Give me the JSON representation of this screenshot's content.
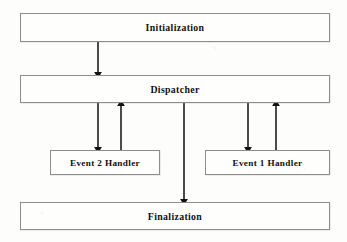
{
  "diagram": {
    "background_color": "#fdfdfb",
    "box_border_color": "#8d8d8d",
    "arrow_color": "#111111",
    "nodes": [
      {
        "id": "initialization",
        "label": "Initialization",
        "x": 20,
        "y": 13,
        "w": 310,
        "h": 29
      },
      {
        "id": "dispatcher",
        "label": "Dispatcher",
        "x": 20,
        "y": 75,
        "w": 310,
        "h": 28
      },
      {
        "id": "event2handler",
        "label": "Event 2 Handler",
        "x": 50,
        "y": 150,
        "w": 110,
        "h": 25
      },
      {
        "id": "event1handler",
        "label": "Event 1 Handler",
        "x": 205,
        "y": 150,
        "w": 125,
        "h": 25
      },
      {
        "id": "finalization",
        "label": "Finalization",
        "x": 20,
        "y": 202,
        "w": 310,
        "h": 28
      }
    ],
    "edges": [
      {
        "id": "init-to-dispatcher",
        "from": "initialization",
        "to": "dispatcher",
        "direction": "down",
        "x": 98,
        "y1": 42,
        "y2": 75
      },
      {
        "id": "dispatcher-to-event2",
        "from": "dispatcher",
        "to": "event2handler",
        "direction": "down",
        "x": 98,
        "y1": 103,
        "y2": 150
      },
      {
        "id": "event2-to-dispatcher",
        "from": "event2handler",
        "to": "dispatcher",
        "direction": "up",
        "x": 121,
        "y1": 150,
        "y2": 103
      },
      {
        "id": "dispatcher-to-event1",
        "from": "dispatcher",
        "to": "event1handler",
        "direction": "down",
        "x": 248,
        "y1": 103,
        "y2": 150
      },
      {
        "id": "event1-to-dispatcher",
        "from": "event1handler",
        "to": "dispatcher",
        "direction": "up",
        "x": 276,
        "y1": 150,
        "y2": 103
      },
      {
        "id": "dispatcher-to-finalization",
        "from": "dispatcher",
        "to": "finalization",
        "direction": "down",
        "x": 184,
        "y1": 103,
        "y2": 202
      }
    ]
  }
}
